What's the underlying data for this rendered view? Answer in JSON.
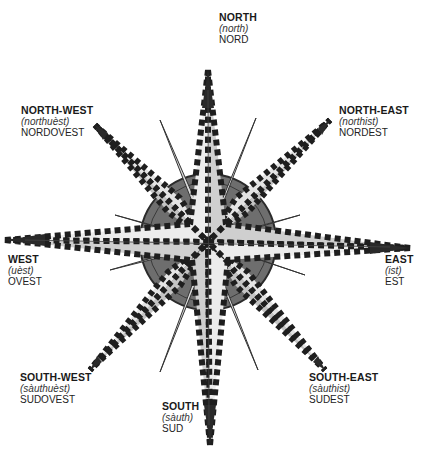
{
  "diagram": {
    "type": "compass-rose",
    "colors": {
      "ring": "#6e6e6e",
      "ring_stroke": "#2b2b2b",
      "point_light": "#e8e8e8",
      "point_mid": "#c9c9c9",
      "point_dark": "#a8a8a8",
      "tip": "#2a2a2a",
      "stripe_dark": "#1e1e1e",
      "stripe_light": "#ffffff"
    }
  },
  "directions": {
    "north": {
      "label": "NORTH",
      "pronunciation": "(north)",
      "italian": "NORD"
    },
    "north_east": {
      "label": "NORTH-EAST",
      "pronunciation": "(northist)",
      "italian": "NORDEST"
    },
    "east": {
      "label": "EAST",
      "pronunciation": "(ist)",
      "italian": "EST"
    },
    "south_east": {
      "label": "SOUTH-EAST",
      "pronunciation": "(sàuthist)",
      "italian": "SUDEST"
    },
    "south": {
      "label": "SOUTH",
      "pronunciation": "(sàuth)",
      "italian": "SUD"
    },
    "south_west": {
      "label": "SOUTH-WEST",
      "pronunciation": "(sàuthuèst)",
      "italian": "SUDOVEST"
    },
    "west": {
      "label": "WEST",
      "pronunciation": "(uèst)",
      "italian": "OVEST"
    },
    "north_west": {
      "label": "NORTH-WEST",
      "pronunciation": "(northuèst)",
      "italian": "NORDOVEST"
    }
  }
}
